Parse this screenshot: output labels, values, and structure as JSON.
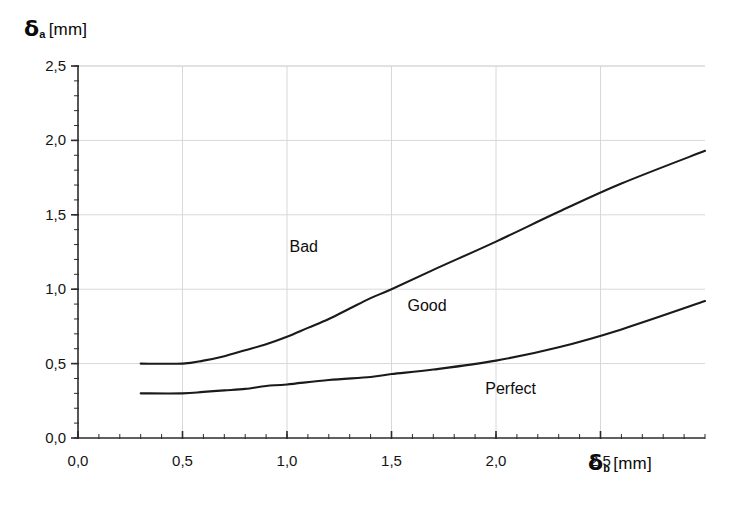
{
  "chart_data": {
    "type": "line",
    "title": "",
    "xlabel": "δb [mm]",
    "ylabel": "δa [mm]",
    "xlim": [
      0.0,
      3.0
    ],
    "ylim": [
      0.0,
      2.5
    ],
    "grid": true,
    "legend": "none",
    "x_ticks": [
      "0,0",
      "0,5",
      "1,0",
      "1,5",
      "2,0",
      "2,5"
    ],
    "x_tick_values": [
      0.0,
      0.5,
      1.0,
      1.5,
      2.0,
      2.5
    ],
    "y_ticks": [
      "0,0",
      "0,5",
      "1,0",
      "1,5",
      "2,0",
      "2,5"
    ],
    "y_tick_values": [
      0.0,
      0.5,
      1.0,
      1.5,
      2.0,
      2.5
    ],
    "minor_ticks_per_interval": 5,
    "series": [
      {
        "name": "upper-boundary",
        "color": "#1a1a1a",
        "x": [
          0.3,
          0.5,
          0.6,
          0.7,
          0.8,
          0.9,
          1.0,
          1.1,
          1.2,
          1.3,
          1.4,
          1.5,
          1.7,
          2.0,
          2.3,
          2.6,
          3.0
        ],
        "y": [
          0.5,
          0.5,
          0.52,
          0.55,
          0.59,
          0.63,
          0.68,
          0.74,
          0.8,
          0.87,
          0.94,
          1.0,
          1.13,
          1.32,
          1.52,
          1.71,
          1.93
        ]
      },
      {
        "name": "lower-boundary",
        "color": "#1a1a1a",
        "x": [
          0.3,
          0.5,
          0.6,
          0.7,
          0.8,
          0.9,
          1.0,
          1.2,
          1.4,
          1.5,
          1.7,
          2.0,
          2.3,
          2.6,
          3.0
        ],
        "y": [
          0.3,
          0.3,
          0.31,
          0.32,
          0.33,
          0.35,
          0.36,
          0.39,
          0.41,
          0.43,
          0.46,
          0.52,
          0.61,
          0.73,
          0.92
        ]
      }
    ],
    "annotations": [
      {
        "text": "Bad",
        "x": 1.08,
        "y": 1.28
      },
      {
        "text": "Good",
        "x": 1.67,
        "y": 0.88
      },
      {
        "text": "Perfect",
        "x": 2.07,
        "y": 0.32
      }
    ]
  },
  "axes": {
    "y_title_symbol": "δ",
    "y_title_sub": "a",
    "y_title_unit": "[mm]",
    "x_title_symbol": "δ",
    "x_title_sub": "b",
    "x_title_unit": "[mm]"
  },
  "colors": {
    "curve": "#1a1a1a",
    "axis": "#2b2b2b",
    "grid": "#d8d8d8",
    "text": "#0d0d0d",
    "background": "#ffffff"
  }
}
